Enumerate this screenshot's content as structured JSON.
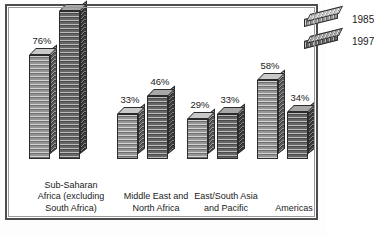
{
  "chart_data": {
    "type": "bar",
    "title": "",
    "subtitle": "",
    "xlabel": "",
    "ylabel": "",
    "ylim": [
      0,
      115
    ],
    "grid": false,
    "legend_position": "top-right",
    "categories": [
      "Sub-Saharan Africa (excluding South Africa)",
      "Middle East and North Africa",
      "East/South Asia and Pacific",
      "Americas"
    ],
    "category_lines": [
      [
        "Sub-Saharan",
        "Africa (excluding",
        "South Africa)"
      ],
      [
        "Middle East and",
        "North Africa"
      ],
      [
        "East/South Asia",
        "and Pacific"
      ],
      [
        "Americas"
      ]
    ],
    "series": [
      {
        "name": "1985",
        "color": "#9d9d9d",
        "values": [
          76,
          33,
          29,
          58
        ],
        "labels": [
          "76%",
          "33%",
          "29%",
          "58%"
        ]
      },
      {
        "name": "1997",
        "color": "#6b6b6b",
        "values": [
          108,
          46,
          33,
          34
        ],
        "labels": [
          "108%",
          "46%",
          "33%",
          "34%"
        ]
      }
    ],
    "value_suffix": "%"
  },
  "legend": {
    "items": [
      {
        "label": "1985",
        "swatch": "bar-swatch-1985"
      },
      {
        "label": "1997",
        "swatch": "bar-swatch-1997"
      }
    ]
  },
  "frame": {
    "border_color": "#4c4c4c",
    "background": "#ffffff"
  }
}
